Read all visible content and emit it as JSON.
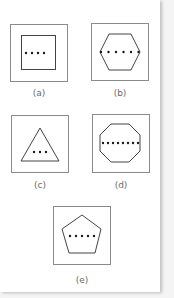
{
  "figure": {
    "panels": [
      {
        "id": "a",
        "label": "(a)",
        "shape": "square",
        "sides": 4,
        "dot_count": 4
      },
      {
        "id": "b",
        "label": "(b)",
        "shape": "hexagon",
        "sides": 6,
        "dot_count": 6
      },
      {
        "id": "c",
        "label": "(c)",
        "shape": "triangle",
        "sides": 3,
        "dot_count": 3
      },
      {
        "id": "d",
        "label": "(d)",
        "shape": "octagon",
        "sides": 8,
        "dot_count": 8
      },
      {
        "id": "e",
        "label": "(e)",
        "shape": "pentagon",
        "sides": 5,
        "dot_count": 5
      }
    ]
  },
  "colors": {
    "frame": "#8a8a8a",
    "shape_stroke": "#444444",
    "dot": "#1a1a1a",
    "label": "#6a6a6a"
  }
}
